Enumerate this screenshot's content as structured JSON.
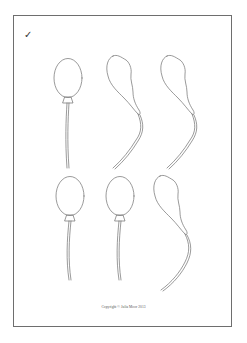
{
  "worksheet": {
    "check_mark": "✓",
    "copyright": "Copyright © Julia Moor 2013",
    "stroke_color": "#6e6e6e",
    "balloons": [
      {
        "row": 1,
        "col": 1,
        "type": "inflated"
      },
      {
        "row": 1,
        "col": 2,
        "type": "deflated"
      },
      {
        "row": 1,
        "col": 3,
        "type": "deflated"
      },
      {
        "row": 2,
        "col": 1,
        "type": "inflated"
      },
      {
        "row": 2,
        "col": 2,
        "type": "inflated"
      },
      {
        "row": 2,
        "col": 3,
        "type": "deflated"
      }
    ]
  }
}
